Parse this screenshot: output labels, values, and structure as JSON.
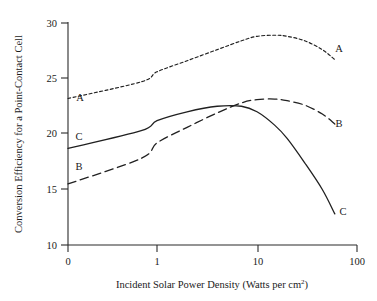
{
  "chart_data": {
    "type": "line",
    "title": "",
    "xlabel": "Incident Solar Power Density (Watts per cm2)",
    "xlabel_main": "Incident Solar Power Density (Watts per cm",
    "xlabel_sup": "2",
    "xlabel_tail": ")",
    "ylabel": "Conversion Efficiency for a Point-Contact Cell",
    "xscale": "log-like",
    "xlim": [
      0,
      100
    ],
    "ylim": [
      10,
      30
    ],
    "grid": false,
    "legend": "inline-curve-labels",
    "xticks": [
      {
        "label": "0",
        "value": 0
      },
      {
        "label": "1",
        "value": 1
      },
      {
        "label": "10",
        "value": 10
      },
      {
        "label": "100",
        "value": 100
      }
    ],
    "yticks": [
      {
        "label": "10",
        "value": 10
      },
      {
        "label": "15",
        "value": 15
      },
      {
        "label": "20",
        "value": 20
      },
      {
        "label": "25",
        "value": 25
      },
      {
        "label": "30",
        "value": 30
      }
    ],
    "series": [
      {
        "name": "A",
        "style": "short-dashed",
        "label_left": "A",
        "label_right": "A",
        "x": [
          0,
          0.5,
          1,
          2,
          4,
          7,
          10,
          15,
          20,
          30,
          45,
          60
        ],
        "values": [
          23.2,
          24.7,
          25.6,
          26.6,
          27.6,
          28.4,
          28.8,
          28.9,
          28.8,
          28.4,
          27.6,
          26.7
        ]
      },
      {
        "name": "B",
        "style": "long-dashed",
        "label_left": "B",
        "label_right": "B",
        "x": [
          0,
          0.5,
          1,
          2,
          4,
          7,
          10,
          15,
          20,
          30,
          45,
          60
        ],
        "values": [
          15.5,
          17.8,
          19.2,
          20.6,
          21.9,
          22.8,
          23.1,
          23.15,
          23.0,
          22.6,
          21.8,
          20.9
        ]
      },
      {
        "name": "C",
        "style": "solid",
        "label_left": "C",
        "label_right": "C",
        "x": [
          0,
          0.5,
          1,
          2,
          4,
          7,
          10,
          15,
          20,
          30,
          45,
          60
        ],
        "values": [
          18.7,
          20.3,
          21.2,
          22.0,
          22.5,
          22.5,
          22.0,
          20.8,
          19.6,
          17.4,
          15.0,
          12.8
        ]
      }
    ]
  },
  "axes": {
    "y_title": "Conversion Efficiency for a Point-Contact Cell",
    "x_title_main": "Incident Solar Power Density (Watts per cm",
    "x_title_sup": "2",
    "x_title_tail": ")"
  },
  "ticks": {
    "y": [
      "30",
      "25",
      "20",
      "15",
      "10"
    ],
    "x": [
      "0",
      "1",
      "10",
      "100"
    ]
  },
  "labels": {
    "a_left": "A",
    "a_right": "A",
    "b_left": "B",
    "b_right": "B",
    "c_left": "C",
    "c_right": "C"
  },
  "colors": {
    "ink": "#202020",
    "background": "#ffffff"
  }
}
